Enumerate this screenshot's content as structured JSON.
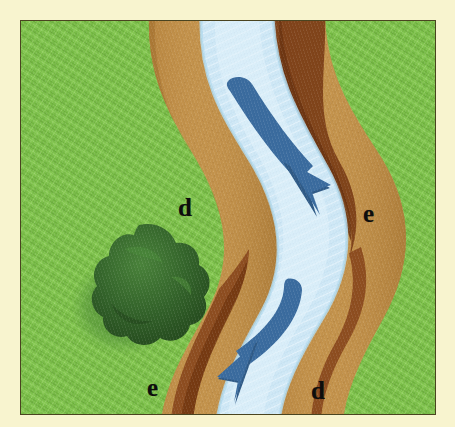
{
  "figure": {
    "mat_color": "#f8f4cf",
    "frame_border_color": "#4a4420"
  },
  "scene": {
    "grass": {
      "name": "grassland",
      "color": "#7ec24c",
      "color_dark": "#63a83a",
      "color_light": "#95d062"
    },
    "water": {
      "name": "river-water",
      "color": "#cfe8f6",
      "color_light": "#e2f2fb",
      "color_edge": "#b4daef"
    },
    "point_bar": {
      "name": "sand-bar-deposition",
      "color": "#c08f48",
      "color_light": "#d6a75f",
      "color_dark": "#a2702f"
    },
    "cut_bank": {
      "name": "cut-bank-erosion",
      "color": "#8a4a1e",
      "color_dark": "#6e3713"
    },
    "bush": {
      "name": "bush",
      "color": "#2f5c23",
      "color_light": "#3f7a2c",
      "shadow_color": "#5a9340"
    },
    "arrow": {
      "name": "flow-arrow",
      "color": "#3a6b9e",
      "color_dark": "#2e5a87"
    }
  },
  "labels": [
    {
      "id": "d-upper",
      "text": "d",
      "meaning": "deposition",
      "x": 157,
      "y": 174
    },
    {
      "id": "e-upper",
      "text": "e",
      "meaning": "erosion",
      "x": 342,
      "y": 180
    },
    {
      "id": "e-lower",
      "text": "e",
      "meaning": "erosion",
      "x": 126,
      "y": 354
    },
    {
      "id": "d-lower",
      "text": "d",
      "meaning": "deposition",
      "x": 290,
      "y": 357
    }
  ],
  "arrows": [
    {
      "id": "upper-flow-arrow",
      "direction": "down-right",
      "description": "curved arrow showing current flowing downstream toward the right bank"
    },
    {
      "id": "lower-flow-arrow",
      "direction": "down-left",
      "description": "curved arrow showing current flowing downstream toward the left bank"
    }
  ]
}
